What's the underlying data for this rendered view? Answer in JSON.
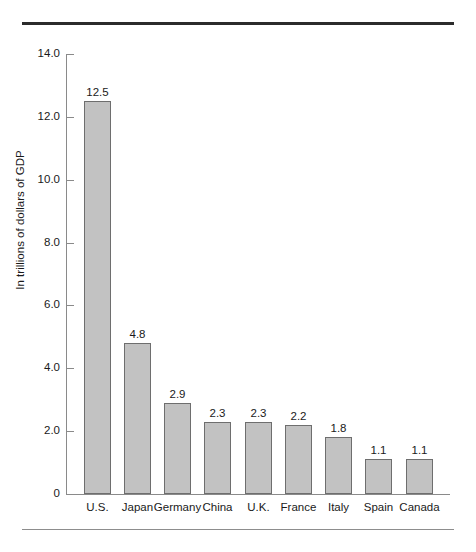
{
  "chart_data": {
    "type": "bar",
    "title": "",
    "subtitle": "",
    "xlabel": "",
    "ylabel": "In trillions of dollars of GDP",
    "categories": [
      "U.S.",
      "Japan",
      "Germany",
      "China",
      "U.K.",
      "France",
      "Italy",
      "Spain",
      "Canada"
    ],
    "values": [
      12.5,
      4.8,
      2.9,
      2.3,
      2.3,
      2.2,
      1.8,
      1.1,
      1.1
    ],
    "value_labels": [
      "12.5",
      "4.8",
      "2.9",
      "2.3",
      "2.3",
      "2.2",
      "1.8",
      "1.1",
      "1.1"
    ],
    "ylim": [
      0,
      14
    ],
    "ytick_values": [
      14.0,
      12.0,
      10.0,
      8.0,
      6.0,
      4.0,
      2.0,
      0
    ],
    "ytick_labels": [
      "14.0",
      "12.0",
      "10.0",
      "8.0",
      "6.0",
      "4.0",
      "2.0",
      "0"
    ],
    "grid": false,
    "legend": false,
    "legend_position": "none",
    "bar_color": "#c2c2c2",
    "bar_border_color": "#6e6e6e",
    "axis_color": "#8a8a8a",
    "text_color": "#1a1a1a",
    "rule_top_color": "#2b2b2b",
    "rule_bottom_color": "#8d8d8d"
  }
}
